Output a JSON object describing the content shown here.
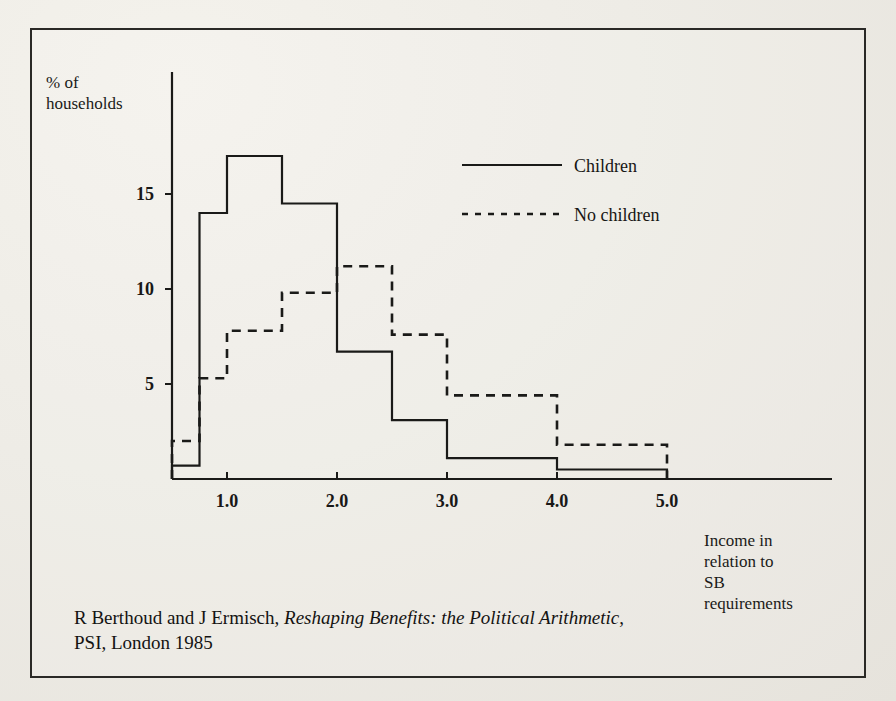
{
  "figure": {
    "y_axis_title_line1": "% of",
    "y_axis_title_line2": "households",
    "x_axis_title_line1": "Income in",
    "x_axis_title_line2": "relation to",
    "x_axis_title_line3": "SB",
    "x_axis_title_line4": "requirements",
    "caption_line1_plain_a": "R Berthoud and J Ermisch, ",
    "caption_line1_italic": "Reshaping Benefits: the Political Arithmetic",
    "caption_line1_plain_b": ",",
    "caption_line2": "PSI, London 1985",
    "ink_color": "#1a1a18",
    "paper_color": "#eceae4"
  },
  "chart_data": {
    "type": "line",
    "title": "",
    "subtitle": "",
    "xlabel": "Income in relation to SB requirements",
    "ylabel": "% of households",
    "xlim": [
      0.25,
      5.75
    ],
    "ylim": [
      0,
      18.5
    ],
    "xticks": [
      "1.0",
      "2.0",
      "3.0",
      "4.0",
      "5.0"
    ],
    "xtick_values": [
      1.0,
      2.0,
      3.0,
      4.0,
      5.0
    ],
    "yticks": [
      "5",
      "10",
      "15"
    ],
    "ytick_values": [
      5,
      10,
      15
    ],
    "grid": false,
    "legend_position": "upper-center-right",
    "bin_edges": [
      0.5,
      0.75,
      1.0,
      1.5,
      2.0,
      2.5,
      3.0,
      4.0,
      5.0
    ],
    "series": [
      {
        "name": "Children",
        "style": "solid",
        "values": [
          0.7,
          14.0,
          17.0,
          14.5,
          6.7,
          3.1,
          1.1,
          0.5
        ]
      },
      {
        "name": "No children",
        "style": "dashed",
        "values": [
          2.0,
          5.3,
          7.8,
          9.8,
          11.2,
          7.6,
          4.4,
          1.8
        ]
      }
    ],
    "legend": [
      {
        "label": "Children",
        "style": "solid"
      },
      {
        "label": "No children",
        "style": "dashed"
      }
    ]
  }
}
